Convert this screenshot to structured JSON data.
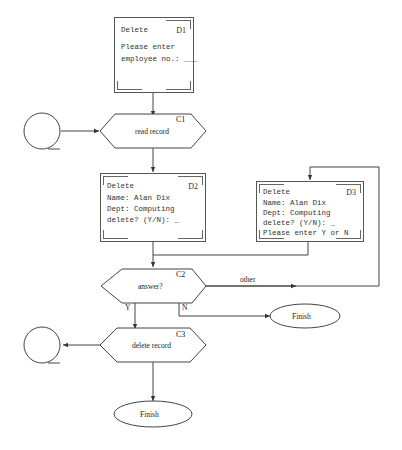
{
  "diagram": {
    "type": "dialogue-flowchart",
    "screens": [
      {
        "id": "D1",
        "title": "Delete",
        "lines": [
          "Please enter",
          "employee no.: ___"
        ]
      },
      {
        "id": "D2",
        "title": "Delete",
        "lines": [
          "Name: Alan Dix",
          "Dept: Computing",
          "delete? (Y/N): _"
        ]
      },
      {
        "id": "D3",
        "title": "Delete",
        "lines": [
          "Name: Alan Dix",
          "Dept: Computing",
          "delete? (Y/N): _",
          "Please enter Y or N"
        ]
      }
    ],
    "computations": [
      {
        "id": "C1",
        "label": "read record"
      },
      {
        "id": "C2",
        "label": "answer?"
      },
      {
        "id": "C3",
        "label": "delete record"
      }
    ],
    "terminals": [
      {
        "label": "Finish"
      },
      {
        "label": "Finish"
      }
    ],
    "edge_labels": {
      "yes": "Y",
      "no": "N",
      "other": "other"
    }
  }
}
